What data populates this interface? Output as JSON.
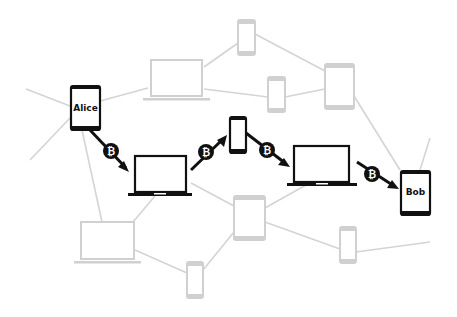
{
  "diagram": {
    "title": "",
    "sender": {
      "label": "Alice",
      "device": "tablet"
    },
    "receiver": {
      "label": "Bob",
      "device": "tablet"
    },
    "coin_symbol": "₿",
    "coin_icon": "bitcoin-icon",
    "colors": {
      "active_path": "#111111",
      "inactive_node": "#d0d0d0",
      "inactive_edge": "#d4d4d4",
      "background": "#ffffff"
    },
    "path_hops": [
      {
        "from": "Alice",
        "to": "laptop-1",
        "device": "laptop"
      },
      {
        "from": "laptop-1",
        "to": "phone-1",
        "device": "phone"
      },
      {
        "from": "phone-1",
        "to": "laptop-2",
        "device": "laptop"
      },
      {
        "from": "laptop-2",
        "to": "Bob",
        "device": "tablet"
      }
    ],
    "coins": [
      {
        "symbol": "₿"
      },
      {
        "symbol": "₿"
      },
      {
        "symbol": "₿"
      },
      {
        "symbol": "₿"
      }
    ],
    "inactive_nodes": [
      {
        "device": "phone"
      },
      {
        "device": "laptop"
      },
      {
        "device": "phone"
      },
      {
        "device": "tablet"
      },
      {
        "device": "laptop"
      },
      {
        "device": "tablet"
      },
      {
        "device": "phone"
      },
      {
        "device": "phone"
      }
    ]
  }
}
